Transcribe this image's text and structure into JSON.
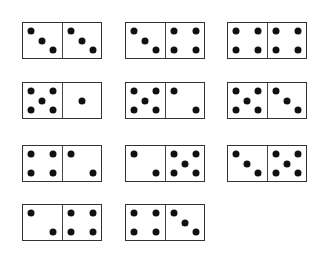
{
  "figure": {
    "colors": {
      "background": "#ffffff",
      "border": "#333333",
      "pip": "#111111"
    },
    "dominoes": [
      {
        "left": 3,
        "right": 3,
        "x": 22,
        "y": 22
      },
      {
        "left": 3,
        "right": 4,
        "x": 125,
        "y": 22
      },
      {
        "left": 4,
        "right": 4,
        "x": 227,
        "y": 22
      },
      {
        "left": 5,
        "right": 1,
        "x": 22,
        "y": 82
      },
      {
        "left": 5,
        "right": 2,
        "x": 125,
        "y": 82
      },
      {
        "left": 5,
        "right": 3,
        "x": 227,
        "y": 82
      },
      {
        "left": 4,
        "right": 2,
        "x": 22,
        "y": 145
      },
      {
        "left": 2,
        "right": 5,
        "x": 125,
        "y": 145
      },
      {
        "left": 3,
        "right": 5,
        "x": 227,
        "y": 145
      },
      {
        "left": 2,
        "right": 4,
        "x": 22,
        "y": 204
      },
      {
        "left": 4,
        "right": 3,
        "x": 125,
        "y": 204
      }
    ]
  }
}
